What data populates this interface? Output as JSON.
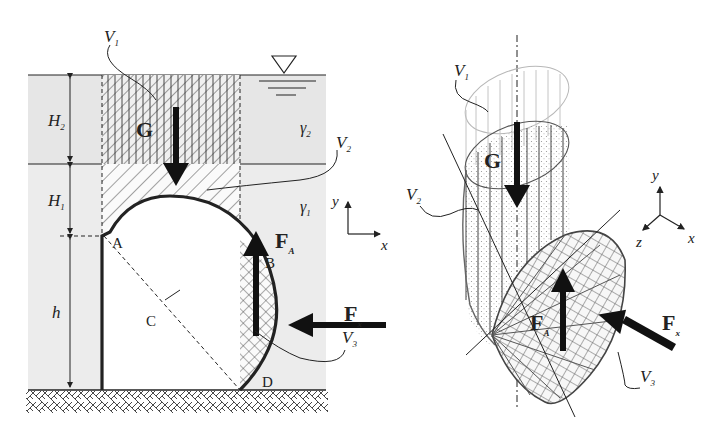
{
  "left_figure": {
    "labels": {
      "V1": "V",
      "V1_sub": "1",
      "V2": "V",
      "V2_sub": "2",
      "V3": "V",
      "V3_sub": "3",
      "G": "G",
      "FA": "F",
      "FA_sub": "A",
      "Fx": "F",
      "Fx_sub": "x",
      "H2": "H",
      "H2_sub": "2",
      "H1": "H",
      "H1_sub": "1",
      "h": "h",
      "gamma2": "γ",
      "gamma2_sub": "2",
      "gamma1": "γ",
      "gamma1_sub": "1",
      "A": "A",
      "B": "B",
      "C": "C",
      "D": "D",
      "axis_y": "y",
      "axis_x": "x"
    }
  },
  "right_figure": {
    "labels": {
      "V1": "V",
      "V1_sub": "1",
      "V2": "V",
      "V2_sub": "2",
      "V3": "V",
      "V3_sub": "3",
      "G": "G",
      "FA": "F",
      "FA_sub": "A",
      "Fx": "F",
      "Fx_sub": "x",
      "axis_y": "y",
      "axis_x": "x",
      "axis_z": "z"
    }
  },
  "colors": {
    "fluid_upper": "#e6e6e6",
    "fluid_lower": "#eeeeee",
    "ink": "#1a1a1a",
    "light_ink": "#9a9a9a"
  }
}
